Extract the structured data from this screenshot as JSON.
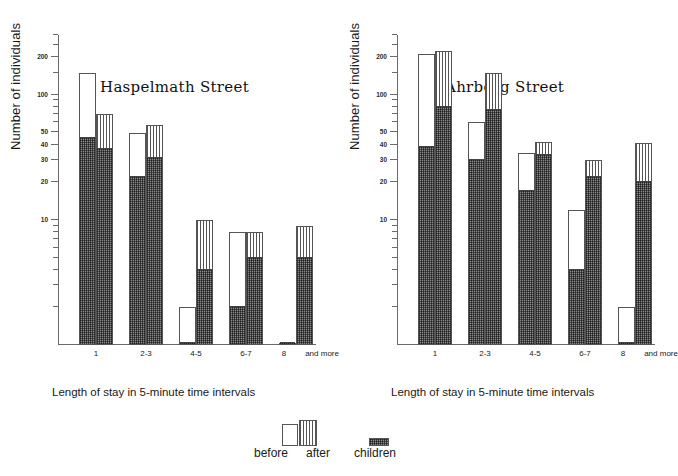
{
  "figure": {
    "y_axis_label": "Number of individuals",
    "x_axis_caption": "Length of stay in 5-minute time intervals",
    "y_tick_labels": [
      "200",
      "100",
      "50",
      "40",
      "30",
      "20",
      "10"
    ],
    "x_tick_labels": [
      "1",
      "2-3",
      "4-5",
      "6-7",
      "8",
      "and more"
    ]
  },
  "legend": {
    "before_label": "before",
    "after_label": "after",
    "children_label": "children",
    "before_swatch": "white-plain-bar-icon",
    "after_swatch": "vertical-striped-bar-icon",
    "children_swatch": "dark-stippled-bar-icon"
  },
  "panels": [
    {
      "title": "Haspelmath Street"
    },
    {
      "title": "Ahrberg Street"
    }
  ],
  "chart_data": [
    {
      "type": "bar",
      "title": "Haspelmath Street",
      "xlabel": "Length of stay in 5-minute time intervals",
      "ylabel": "Number of individuals",
      "yscale": "log",
      "ylim": [
        1,
        300
      ],
      "yticks": [
        10,
        20,
        30,
        40,
        50,
        100,
        200
      ],
      "grid": false,
      "legend_position": "bottom-center-shared",
      "categories": [
        "1",
        "2-3",
        "4-5",
        "6-7",
        "8 and more"
      ],
      "series": [
        {
          "name": "before",
          "values": [
            150,
            49,
            2,
            8,
            1
          ]
        },
        {
          "name": "after",
          "values": [
            70,
            57,
            10,
            8,
            9
          ]
        },
        {
          "name": "children (within before)",
          "values": [
            45,
            22,
            1,
            2,
            1
          ]
        },
        {
          "name": "children (within after)",
          "values": [
            37,
            31,
            4,
            5,
            5
          ]
        }
      ]
    },
    {
      "type": "bar",
      "title": "Ahrberg Street",
      "xlabel": "Length of stay in 5-minute time intervals",
      "ylabel": "Number of individuals",
      "yscale": "log",
      "ylim": [
        1,
        300
      ],
      "yticks": [
        10,
        20,
        30,
        40,
        50,
        100,
        200
      ],
      "grid": false,
      "legend_position": "bottom-center-shared",
      "categories": [
        "1",
        "2-3",
        "4-5",
        "6-7",
        "8 and more"
      ],
      "series": [
        {
          "name": "before",
          "values": [
            210,
            60,
            34,
            12,
            2
          ]
        },
        {
          "name": "after",
          "values": [
            225,
            150,
            42,
            30,
            41
          ]
        },
        {
          "name": "children (within before)",
          "values": [
            38,
            30,
            17,
            4,
            1
          ]
        },
        {
          "name": "children (within after)",
          "values": [
            80,
            75,
            33,
            22,
            20
          ]
        }
      ]
    }
  ]
}
